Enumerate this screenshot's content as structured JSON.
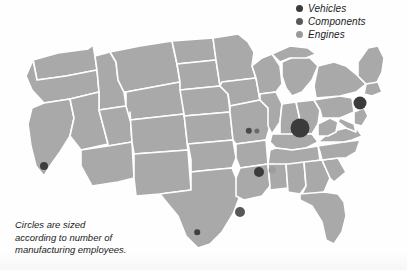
{
  "figure": {
    "type": "bubble-map",
    "region": "United States",
    "map_fill": "#a9a9a9",
    "border_color": "#ffffff",
    "background": "#fefefe"
  },
  "legend": {
    "items": [
      {
        "label": "Vehicles",
        "color": "#3b3b3b"
      },
      {
        "label": "Components",
        "color": "#595959"
      },
      {
        "label": "Engines",
        "color": "#9a9a9a"
      }
    ]
  },
  "caption": {
    "lines": [
      "Circles are sized",
      "according to number of",
      "manufacturing employees."
    ]
  },
  "chart_data": {
    "type": "bubble-map",
    "title": "",
    "size_encoding": "number of manufacturing employees",
    "categories": [
      "Vehicles",
      "Components",
      "Engines"
    ],
    "points": [
      {
        "category": "Vehicles",
        "x": 300,
        "y": 128,
        "r": 9.5,
        "color": "#3b3b3b"
      },
      {
        "category": "Vehicles",
        "x": 360,
        "y": 103,
        "r": 6.5,
        "color": "#3b3b3b"
      },
      {
        "category": "Vehicles",
        "x": 259,
        "y": 172,
        "r": 5.0,
        "color": "#3b3b3b"
      },
      {
        "category": "Components",
        "x": 240,
        "y": 212,
        "r": 5.0,
        "color": "#585858"
      },
      {
        "category": "Vehicles",
        "x": 44,
        "y": 166,
        "r": 4.0,
        "color": "#3d3d3d"
      },
      {
        "category": "Vehicles",
        "x": 249,
        "y": 131,
        "r": 3.2,
        "color": "#4a4a4a"
      },
      {
        "category": "Components",
        "x": 257,
        "y": 131,
        "r": 2.6,
        "color": "#6a6a6a"
      },
      {
        "category": "Vehicles",
        "x": 197,
        "y": 232,
        "r": 2.8,
        "color": "#3f3f3f"
      },
      {
        "category": "Engines",
        "x": 272,
        "y": 170,
        "r": 3.4,
        "color": "#9d9d9d"
      }
    ]
  }
}
